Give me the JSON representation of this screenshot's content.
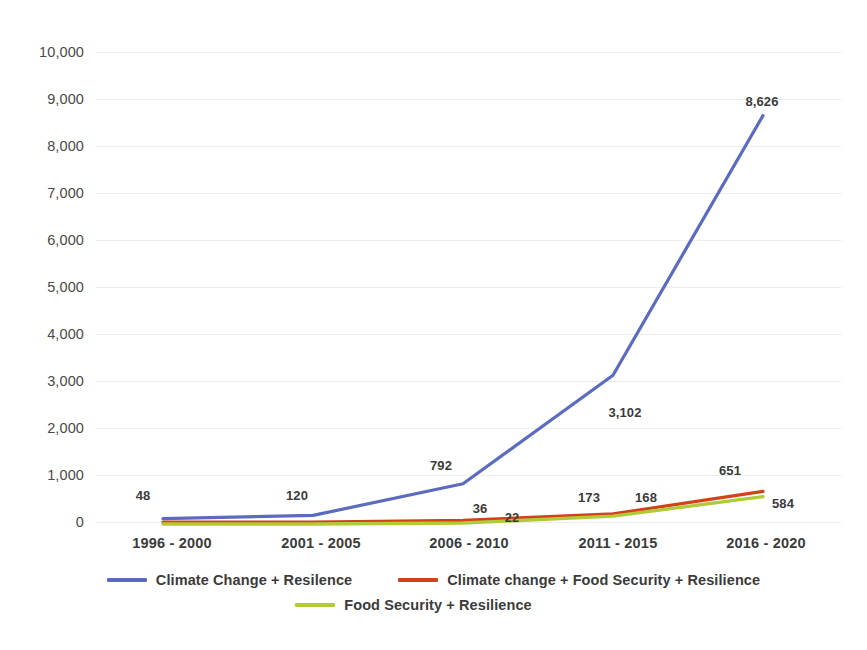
{
  "chart_data": {
    "type": "line",
    "title": "",
    "xlabel": "",
    "ylabel": "",
    "categories": [
      "1996 - 2000",
      "2001 - 2005",
      "2006 - 2010",
      "2011 - 2015",
      "2016 - 2020"
    ],
    "ylim": [
      0,
      10000
    ],
    "ytick_labels": [
      "10,000",
      "9,000",
      "8,000",
      "7,000",
      "6,000",
      "5,000",
      "4,000",
      "3,000",
      "2,000",
      "1,000",
      "0"
    ],
    "ytick_values": [
      10000,
      9000,
      8000,
      7000,
      6000,
      5000,
      4000,
      3000,
      2000,
      1000,
      0
    ],
    "grid": "horizontal",
    "legend_position": "bottom",
    "series": [
      {
        "name": "Climate Change + Resilence",
        "color": "#5B6BC0",
        "values": [
          48,
          120,
          792,
          3102,
          8626
        ],
        "labels": [
          "48",
          "120",
          "792",
          "3,102",
          "8,626"
        ]
      },
      {
        "name": "Climate change + Food Security + Resilience",
        "color": "#D1421A",
        "values": [
          null,
          null,
          36,
          173,
          651
        ],
        "labels": [
          "",
          "",
          "36",
          "173",
          "651"
        ]
      },
      {
        "name": "Food Security + Resilience",
        "color": "#AFCB38",
        "values": [
          null,
          null,
          22,
          168,
          584
        ],
        "labels": [
          "",
          "",
          "22",
          "168",
          "584"
        ]
      }
    ]
  },
  "axis": {
    "y": {
      "t0": "10,000",
      "t1": "9,000",
      "t2": "8,000",
      "t3": "7,000",
      "t4": "6,000",
      "t5": "5,000",
      "t6": "4,000",
      "t7": "3,000",
      "t8": "2,000",
      "t9": "1,000",
      "t10": "0"
    },
    "x": {
      "c0": "1996 - 2000",
      "c1": "2001 - 2005",
      "c2": "2006 - 2010",
      "c3": "2011 - 2015",
      "c4": "2016 - 2020"
    }
  },
  "labels": {
    "blue_1996": "48",
    "blue_2001": "120",
    "blue_2006": "792",
    "blue_2011": "3,102",
    "blue_2016": "8,626",
    "red_2006": "36",
    "red_2011": "173",
    "red_2016": "651",
    "green_2006": "22",
    "green_2011": "168",
    "green_2016": "584"
  },
  "legend": {
    "item0": "Climate Change + Resilence",
    "item1": "Climate change + Food Security + Resilience",
    "item2": "Food Security + Resilience"
  }
}
